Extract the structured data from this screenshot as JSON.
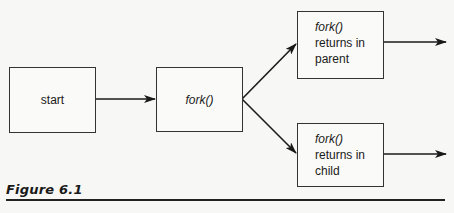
{
  "diagram": {
    "nodes": {
      "start": {
        "label": "start"
      },
      "fork": {
        "label": "fork()"
      },
      "parent": {
        "line1": "fork()",
        "line2": "returns in",
        "line3": "parent"
      },
      "child": {
        "line1": "fork()",
        "line2": "returns in",
        "line3": "child"
      }
    },
    "edges": [
      {
        "from": "start",
        "to": "fork"
      },
      {
        "from": "fork",
        "to": "parent"
      },
      {
        "from": "fork",
        "to": "child"
      },
      {
        "from": "parent",
        "to": "offscreen-right"
      },
      {
        "from": "child",
        "to": "offscreen-right"
      }
    ]
  },
  "caption": {
    "text": "Figure 6.1"
  },
  "colors": {
    "line": "#1a1a1a",
    "background": "#f7f7f5"
  }
}
